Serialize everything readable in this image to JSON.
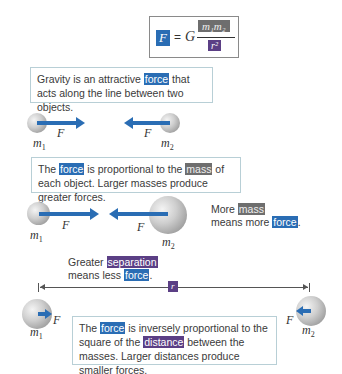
{
  "equation": {
    "lhs": "F",
    "equals": "=",
    "constant": "G",
    "numerator": "m₁m₂",
    "denominator": "r²"
  },
  "panels": [
    {
      "caption": {
        "before": "Gravity is an attractive ",
        "highlight": "force",
        "after": " that acts along the line between two objects."
      },
      "left_mass": "m",
      "left_sub": "1",
      "right_mass": "m",
      "right_sub": "2",
      "force_label": "F"
    },
    {
      "caption": {
        "part1": "The ",
        "hl1": "force",
        "part2": " is proportional to the ",
        "hl2": "mass",
        "part3": " of each object. Larger masses produce greater forces."
      },
      "left_mass": "m",
      "left_sub": "1",
      "right_mass": "m",
      "right_sub": "2",
      "force_label": "F",
      "side_note": {
        "line1_before": "More ",
        "line1_hl": "mass",
        "line2_before": "means more ",
        "line2_hl": "force",
        "line2_after": "."
      }
    },
    {
      "top_note": {
        "line1_before": "Greater ",
        "line1_hl": "separation",
        "line2_before": "means less ",
        "line2_hl": "force",
        "line2_after": "."
      },
      "distance_label": "r",
      "caption": {
        "part1": "The ",
        "hl1": "force",
        "part2": " is inversely proportional to the square of the ",
        "hl2": "distance",
        "part3": " between the masses. Larger distances produce smaller forces."
      },
      "left_mass": "m",
      "left_sub": "1",
      "right_mass": "m",
      "right_sub": "2",
      "force_label": "F"
    }
  ],
  "colors": {
    "force": "#2a6db4",
    "mass": "#6e6e6e",
    "distance": "#5b3f85",
    "box_border": "#b8cfd6"
  }
}
